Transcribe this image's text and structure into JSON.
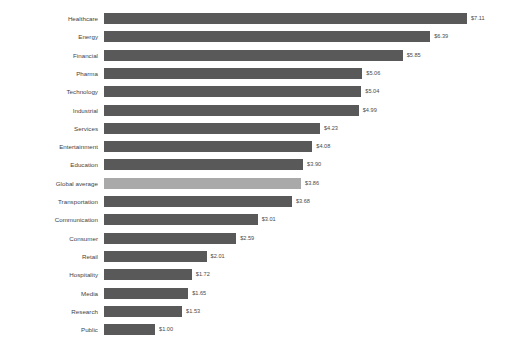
{
  "chart_data": {
    "type": "bar",
    "orientation": "horizontal",
    "title": "",
    "subtitle": "",
    "xlabel": "",
    "ylabel": "",
    "grid": false,
    "legend": null,
    "axis_visible": false,
    "tick_labels_x": [],
    "xlim": [
      0,
      7.11
    ],
    "categories": [
      "Healthcare",
      "Energy",
      "Financial",
      "Pharma",
      "Technology",
      "Industrial",
      "Services",
      "Entertainment",
      "Education",
      "Global average",
      "Transportation",
      "Communication",
      "Consumer",
      "Retail",
      "Hospitality",
      "Media",
      "Research",
      "Public"
    ],
    "values": [
      7.11,
      6.39,
      5.85,
      5.06,
      5.04,
      4.99,
      4.23,
      4.08,
      3.9,
      3.86,
      3.68,
      3.01,
      2.59,
      2.01,
      1.72,
      1.65,
      1.53,
      1.0
    ],
    "data_labels": [
      "$7.11",
      "$6.39",
      "$5.85",
      "$5.06",
      "$5.04",
      "$4.99",
      "$4.23",
      "$4.08",
      "$3.90",
      "$3.86",
      "$3.68",
      "$3.01",
      "$2.59",
      "$2.01",
      "$1.72",
      "$1.65",
      "$1.53",
      "$1.00"
    ],
    "highlight_category": "Global average",
    "colors": {
      "bar": "#595959",
      "bar_highlight": "#a9a9a9",
      "label_text": "#3f3f3f",
      "value_text": "#4a4a4a",
      "background": "#ffffff"
    }
  }
}
